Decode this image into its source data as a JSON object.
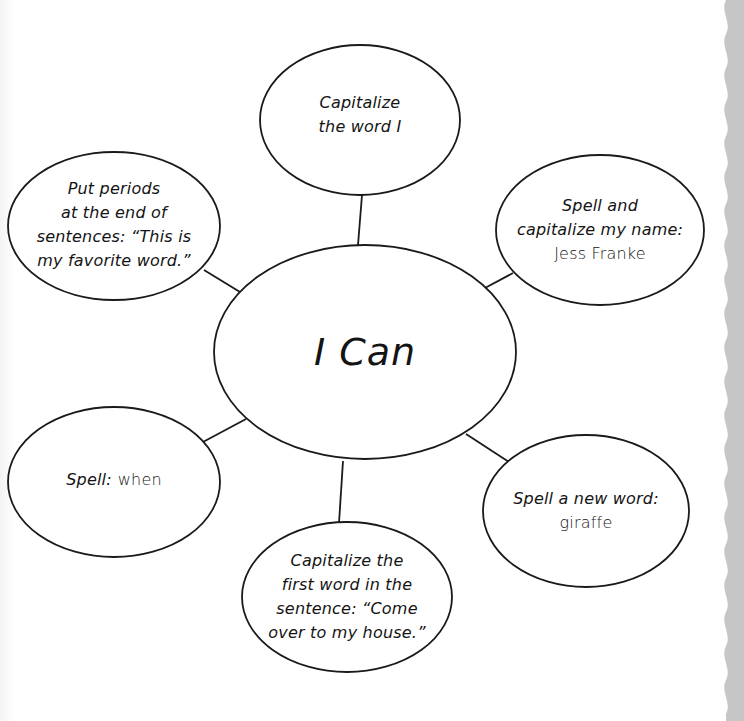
{
  "diagram": {
    "title": "I Can",
    "colors": {
      "stroke": "#1a1a1a",
      "fill": "#ffffff",
      "edge_border": "#c4c4c4",
      "text": "#141414"
    },
    "center": {
      "label": "I Can",
      "cx": 365,
      "cy": 352,
      "rx": 151,
      "ry": 107
    },
    "bubbles": [
      {
        "id": "top",
        "lines": [
          "Capitalize",
          "the word I"
        ],
        "cx": 360,
        "cy": 120,
        "rx": 100,
        "ry": 75
      },
      {
        "id": "top-left",
        "lines": [
          "Put periods",
          "at the end of",
          "sentences: “This is",
          "my favorite word.”"
        ],
        "cx": 114,
        "cy": 226,
        "rx": 106,
        "ry": 74
      },
      {
        "id": "top-right",
        "lines": [
          "Spell and",
          "capitalize my name:"
        ],
        "example": "Jess Franke",
        "cx": 600,
        "cy": 230,
        "rx": 104,
        "ry": 75
      },
      {
        "id": "bottom-left",
        "lines": [
          "Spell:"
        ],
        "example": "when",
        "cx": 114,
        "cy": 482,
        "rx": 106,
        "ry": 75
      },
      {
        "id": "bottom-right",
        "lines": [
          "Spell a new word:"
        ],
        "example": "giraffe",
        "cx": 586,
        "cy": 511,
        "rx": 103,
        "ry": 76
      },
      {
        "id": "bottom",
        "lines": [
          "Capitalize the",
          "first word in the",
          "sentence: “Come",
          "over to my house.”"
        ],
        "cx": 347,
        "cy": 597,
        "rx": 105,
        "ry": 75
      }
    ],
    "connectors": [
      {
        "to": "top",
        "x1": 362,
        "y1": 195,
        "x2": 358,
        "y2": 245
      },
      {
        "to": "top-left",
        "x1": 204,
        "y1": 270,
        "x2": 240,
        "y2": 292
      },
      {
        "to": "top-right",
        "x1": 485,
        "y1": 288,
        "x2": 513,
        "y2": 273
      },
      {
        "to": "bottom-left",
        "x1": 203,
        "y1": 442,
        "x2": 246,
        "y2": 419
      },
      {
        "to": "bottom-right",
        "x1": 466,
        "y1": 434,
        "x2": 509,
        "y2": 462
      },
      {
        "to": "bottom",
        "x1": 343,
        "y1": 461,
        "x2": 339,
        "y2": 523
      }
    ]
  }
}
